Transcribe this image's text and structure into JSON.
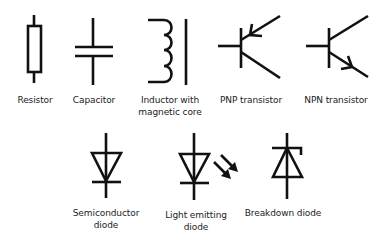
{
  "colors": {
    "stroke": "#111111",
    "background": "#ffffff",
    "text": "#222222"
  },
  "symbols": [
    {
      "id": "resistor",
      "label_lines": [
        "Resistor"
      ]
    },
    {
      "id": "capacitor",
      "label_lines": [
        "Capacitor"
      ]
    },
    {
      "id": "inductor",
      "label_lines": [
        "Inductor with",
        "magnetic core"
      ]
    },
    {
      "id": "pnp",
      "label_lines": [
        "PNP transistor"
      ]
    },
    {
      "id": "npn",
      "label_lines": [
        "NPN transistor"
      ]
    },
    {
      "id": "diode",
      "label_lines": [
        "Semiconductor",
        "diode"
      ]
    },
    {
      "id": "led",
      "label_lines": [
        "Light emitting",
        "diode"
      ]
    },
    {
      "id": "zener",
      "label_lines": [
        "Breakdown diode"
      ]
    }
  ]
}
